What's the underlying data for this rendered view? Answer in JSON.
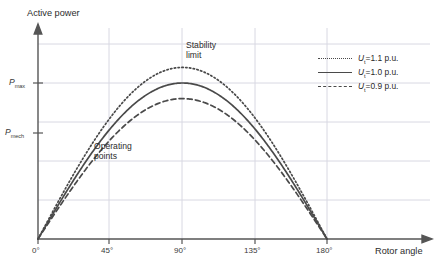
{
  "chart_data": {
    "type": "line",
    "title": "",
    "xlabel": "Rotor angle",
    "ylabel": "Active power",
    "xlim": [
      0,
      200
    ],
    "ylim": [
      0,
      1.36
    ],
    "grid": true,
    "x_ticks": [
      "0°",
      "45°",
      "90°",
      "135°",
      "180°"
    ],
    "x_tick_values": [
      0,
      45,
      90,
      135,
      180
    ],
    "y_ticks": [
      "P",
      "P"
    ],
    "y_tick_labels": [
      {
        "symbol": "P",
        "subscript": "max",
        "value": 1.0
      },
      {
        "symbol": "P",
        "subscript": "mech",
        "value": 0.68
      }
    ],
    "y_gridline_values": [
      0.27,
      0.54,
      0.81,
      1.08,
      1.25
    ],
    "legend_position": "top-right",
    "series": [
      {
        "name": "Uₜ=1.1 p.u.",
        "symbol": "U",
        "subscript": "t",
        "value_label": "=1.1 p.u.",
        "amplitude": 1.1,
        "style": "dotted",
        "color": "#4a4a4a",
        "peak_angle": 90,
        "peak_value": 1.1
      },
      {
        "name": "Uₜ=1.0 p.u.",
        "symbol": "U",
        "subscript": "t",
        "value_label": "=1.0 p.u.",
        "amplitude": 1.0,
        "style": "solid",
        "color": "#4a4a4a",
        "peak_angle": 90,
        "peak_value": 1.0
      },
      {
        "name": "Uₜ=0.9 p.u.",
        "symbol": "U",
        "subscript": "t",
        "value_label": "=0.9 p.u.",
        "amplitude": 0.9,
        "style": "dashed",
        "color": "#4a4a4a",
        "peak_angle": 90,
        "peak_value": 0.9
      }
    ],
    "annotations": [
      {
        "id": "stability-limit",
        "line1": "Stability",
        "line2": "limit",
        "x": 90,
        "y": 1.24
      },
      {
        "id": "operating-points",
        "line1": "Operating",
        "line2": "points",
        "x": 30,
        "y": 0.64
      }
    ]
  },
  "axes": {
    "y_title": "Active power",
    "x_title": "Rotor angle",
    "pmax_symbol": "P",
    "pmax_sub": "max",
    "pmech_symbol": "P",
    "pmech_sub": "mech"
  },
  "ticks": {
    "x0": "0°",
    "x1": "45°",
    "x2": "90°",
    "x3": "135°",
    "x4": "180°"
  },
  "annotations": {
    "stability_l1": "Stability",
    "stability_l2": "limit",
    "operating_l1": "Operating",
    "operating_l2": "points"
  },
  "legend": {
    "rows": [
      {
        "sym": "U",
        "sub": "t",
        "rest": "=1.1 p.u."
      },
      {
        "sym": "U",
        "sub": "t",
        "rest": "=1.0 p.u."
      },
      {
        "sym": "U",
        "sub": "t",
        "rest": "=0.9 p.u."
      }
    ]
  },
  "colors": {
    "curve": "#4a4a4a",
    "axis": "#555555",
    "grid": "#d8d8e2",
    "text": "#2b2b2b"
  }
}
